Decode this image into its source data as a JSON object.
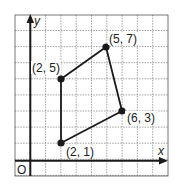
{
  "chart_data": {
    "type": "scatter",
    "title": "",
    "xlabel": "x",
    "ylabel": "y",
    "origin_label": "O",
    "xlim": [
      -1,
      9
    ],
    "ylim": [
      -1,
      9
    ],
    "grid": true,
    "grid_style": "dotted",
    "points": [
      {
        "x": 2,
        "y": 1,
        "label": "(2, 1)"
      },
      {
        "x": 2,
        "y": 5,
        "label": "(2, 5)"
      },
      {
        "x": 5,
        "y": 7,
        "label": "(5, 7)"
      },
      {
        "x": 6,
        "y": 3,
        "label": "(6, 3)"
      }
    ],
    "polygon": {
      "vertices": [
        [
          2,
          1
        ],
        [
          2,
          5
        ],
        [
          5,
          7
        ],
        [
          6,
          3
        ]
      ],
      "closed": true,
      "shape": "quadrilateral"
    }
  },
  "labels": {
    "x_axis": "x",
    "y_axis": "y",
    "origin": "O",
    "p1": "(2, 1)",
    "p2": "(2, 5)",
    "p3": "(5, 7)",
    "p4": "(6, 3)"
  },
  "colors": {
    "ink": "#1a1a1a",
    "grid": "#7a7a7a",
    "background": "#ffffff"
  }
}
